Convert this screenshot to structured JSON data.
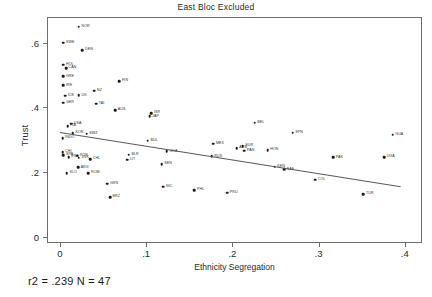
{
  "chart": {
    "title": "East Bloc Excluded",
    "xlabel": "Ethnicity Segregation",
    "ylabel": "Trust",
    "caption": "r2 = .239  N = 47"
  },
  "chart_data": {
    "type": "scatter",
    "title": "East Bloc Excluded",
    "xlabel": "Ethnicity Segregation",
    "ylabel": "Trust",
    "xlim": [
      -0.015,
      0.42
    ],
    "ylim": [
      -0.02,
      0.68
    ],
    "xticks": [
      "0",
      ".1",
      ".2",
      ".3",
      ".4"
    ],
    "xtick_values": [
      0,
      0.1,
      0.2,
      0.3,
      0.4
    ],
    "yticks": [
      "0",
      ".2",
      ".4",
      ".6"
    ],
    "ytick_values": [
      0,
      0.2,
      0.4,
      0.6
    ],
    "grid": false,
    "legend": null,
    "annotation": "r2 = .239  N = 47",
    "r2": 0.239,
    "n": 47,
    "fit_line": {
      "type": "linear",
      "x_start": 0.0,
      "y_start": 0.325,
      "x_end": 0.395,
      "y_end": 0.157
    },
    "points": [
      {
        "label": "NOR",
        "x": 0.022,
        "y": 0.65
      },
      {
        "label": "SWE",
        "x": 0.004,
        "y": 0.6
      },
      {
        "label": "DEN",
        "x": 0.026,
        "y": 0.578
      },
      {
        "label": "HOL",
        "x": 0.004,
        "y": 0.532
      },
      {
        "label": "CAN",
        "x": 0.007,
        "y": 0.522
      },
      {
        "label": "GRE",
        "x": 0.004,
        "y": 0.496
      },
      {
        "label": "IRE",
        "x": 0.004,
        "y": 0.468
      },
      {
        "label": "FIN",
        "x": 0.069,
        "y": 0.482
      },
      {
        "label": "NZ",
        "x": 0.04,
        "y": 0.452
      },
      {
        "label": "ICE",
        "x": 0.006,
        "y": 0.436
      },
      {
        "label": "UK",
        "x": 0.022,
        "y": 0.437
      },
      {
        "label": "GER",
        "x": 0.004,
        "y": 0.414
      },
      {
        "label": "TAI",
        "x": 0.042,
        "y": 0.412
      },
      {
        "label": "AUS",
        "x": 0.064,
        "y": 0.392
      },
      {
        "label": "ISR",
        "x": 0.106,
        "y": 0.382
      },
      {
        "label": "JAP",
        "x": 0.104,
        "y": 0.372
      },
      {
        "label": "USA",
        "x": 0.013,
        "y": 0.35
      },
      {
        "label": "ITA",
        "x": 0.009,
        "y": 0.342
      },
      {
        "label": "KOR",
        "x": 0.015,
        "y": 0.32
      },
      {
        "label": "SWZ",
        "x": 0.031,
        "y": 0.318
      },
      {
        "label": "INDO",
        "x": 0.003,
        "y": 0.305
      },
      {
        "label": "BEL",
        "x": 0.226,
        "y": 0.352
      },
      {
        "label": "SPN",
        "x": 0.27,
        "y": 0.322
      },
      {
        "label": "BUL",
        "x": 0.102,
        "y": 0.297
      },
      {
        "label": "MEX",
        "x": 0.178,
        "y": 0.288
      },
      {
        "label": "SUR",
        "x": 0.212,
        "y": 0.28
      },
      {
        "label": "AUS2",
        "x": 0.205,
        "y": 0.274
      },
      {
        "label": "PAN",
        "x": 0.214,
        "y": 0.266
      },
      {
        "label": "HON",
        "x": 0.241,
        "y": 0.268
      },
      {
        "label": "GUA",
        "x": 0.386,
        "y": 0.316
      },
      {
        "label": "UGA",
        "x": 0.376,
        "y": 0.246
      },
      {
        "label": "PAK",
        "x": 0.317,
        "y": 0.245
      },
      {
        "label": "CHI",
        "x": 0.003,
        "y": 0.262
      },
      {
        "label": "SPA",
        "x": 0.004,
        "y": 0.252
      },
      {
        "label": "POR",
        "x": 0.02,
        "y": 0.25
      },
      {
        "label": "EST",
        "x": 0.01,
        "y": 0.246
      },
      {
        "label": "SVK",
        "x": 0.022,
        "y": 0.244
      },
      {
        "label": "CHL",
        "x": 0.035,
        "y": 0.24
      },
      {
        "label": "BLR",
        "x": 0.08,
        "y": 0.254
      },
      {
        "label": "LIT",
        "x": 0.078,
        "y": 0.238
      },
      {
        "label": "GHA",
        "x": 0.124,
        "y": 0.264
      },
      {
        "label": "RUS",
        "x": 0.176,
        "y": 0.248
      },
      {
        "label": "SEN",
        "x": 0.118,
        "y": 0.224
      },
      {
        "label": "KEN",
        "x": 0.249,
        "y": 0.216
      },
      {
        "label": "SAF",
        "x": 0.26,
        "y": 0.208
      },
      {
        "label": "ARG",
        "x": 0.021,
        "y": 0.214
      },
      {
        "label": "SLO",
        "x": 0.008,
        "y": 0.196
      },
      {
        "label": "ROM",
        "x": 0.033,
        "y": 0.196
      },
      {
        "label": "COL",
        "x": 0.296,
        "y": 0.176
      },
      {
        "label": "GRN",
        "x": 0.055,
        "y": 0.164
      },
      {
        "label": "NIC",
        "x": 0.12,
        "y": 0.154
      },
      {
        "label": "PHL",
        "x": 0.156,
        "y": 0.144
      },
      {
        "label": "PRU",
        "x": 0.194,
        "y": 0.136
      },
      {
        "label": "TUR",
        "x": 0.352,
        "y": 0.132
      },
      {
        "label": "BRZ",
        "x": 0.058,
        "y": 0.122
      }
    ]
  }
}
